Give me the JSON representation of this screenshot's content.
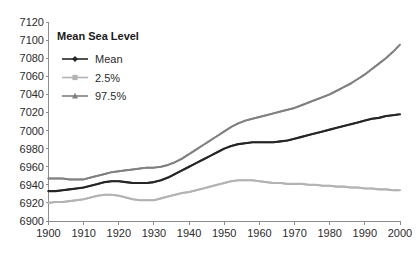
{
  "chart_data": {
    "type": "line",
    "title": "Mean Sea Level",
    "xlabel": "",
    "ylabel": "",
    "xlim": [
      1900,
      2000
    ],
    "ylim": [
      6900,
      7120
    ],
    "xticks": [
      1900,
      1910,
      1920,
      1930,
      1940,
      1950,
      1960,
      1970,
      1980,
      1990,
      2000
    ],
    "yticks": [
      6900,
      6920,
      6940,
      6960,
      6980,
      7000,
      7020,
      7040,
      7060,
      7080,
      7100,
      7120
    ],
    "grid": false,
    "legend_position": "top-left",
    "x": [
      1900,
      1902,
      1904,
      1906,
      1908,
      1910,
      1912,
      1914,
      1916,
      1918,
      1920,
      1922,
      1924,
      1926,
      1928,
      1930,
      1932,
      1934,
      1936,
      1938,
      1940,
      1942,
      1944,
      1946,
      1948,
      1950,
      1952,
      1954,
      1956,
      1958,
      1960,
      1962,
      1964,
      1966,
      1968,
      1970,
      1972,
      1974,
      1976,
      1978,
      1980,
      1982,
      1984,
      1986,
      1988,
      1990,
      1992,
      1994,
      1996,
      1998,
      2000
    ],
    "series": [
      {
        "name": "Mean",
        "marker": "diamond",
        "color": "#262626",
        "values": [
          6933,
          6933,
          6934,
          6935,
          6936,
          6937,
          6939,
          6941,
          6943,
          6944,
          6944,
          6943,
          6942,
          6942,
          6942,
          6943,
          6945,
          6948,
          6952,
          6956,
          6960,
          6964,
          6968,
          6972,
          6976,
          6980,
          6983,
          6985,
          6986,
          6987,
          6987,
          6987,
          6987,
          6988,
          6989,
          6991,
          6993,
          6995,
          6997,
          6999,
          7001,
          7003,
          7005,
          7007,
          7009,
          7011,
          7013,
          7014,
          7016,
          7017,
          7018
        ]
      },
      {
        "name": "2.5%",
        "marker": "square",
        "color": "#b3b3b3",
        "values": [
          6920,
          6921,
          6921,
          6922,
          6923,
          6924,
          6926,
          6928,
          6929,
          6929,
          6928,
          6926,
          6924,
          6923,
          6923,
          6923,
          6925,
          6927,
          6929,
          6931,
          6932,
          6934,
          6936,
          6938,
          6940,
          6942,
          6944,
          6945,
          6945,
          6945,
          6944,
          6943,
          6942,
          6942,
          6941,
          6941,
          6941,
          6940,
          6940,
          6939,
          6939,
          6938,
          6938,
          6937,
          6937,
          6936,
          6936,
          6935,
          6935,
          6934,
          6934
        ]
      },
      {
        "name": "97.5%",
        "marker": "triangle",
        "color": "#808080",
        "values": [
          6947,
          6947,
          6947,
          6946,
          6946,
          6946,
          6948,
          6950,
          6952,
          6954,
          6955,
          6956,
          6957,
          6958,
          6959,
          6959,
          6960,
          6962,
          6965,
          6969,
          6974,
          6979,
          6984,
          6989,
          6994,
          6999,
          7004,
          7008,
          7011,
          7013,
          7015,
          7017,
          7019,
          7021,
          7023,
          7025,
          7028,
          7031,
          7034,
          7037,
          7040,
          7044,
          7048,
          7052,
          7057,
          7062,
          7068,
          7074,
          7080,
          7087,
          7095
        ]
      }
    ]
  },
  "legend": {
    "title": "Mean Sea Level",
    "entries": [
      {
        "label": "Mean",
        "marker": "diamond-marker",
        "color": "#262626"
      },
      {
        "label": "2.5%",
        "marker": "square-marker",
        "color": "#b3b3b3"
      },
      {
        "label": "97.5%",
        "marker": "triangle-marker",
        "color": "#808080"
      }
    ]
  },
  "axes": {
    "y_tick_labels": [
      "7120",
      "7100",
      "7080",
      "7060",
      "7040",
      "7020",
      "7000",
      "6980",
      "6960",
      "6940",
      "6920",
      "6900"
    ],
    "x_tick_labels": [
      "1900",
      "1910",
      "1920",
      "1930",
      "1940",
      "1950",
      "1960",
      "1970",
      "1980",
      "1990",
      "2000"
    ],
    "axis_color": "#8c8c8c"
  }
}
